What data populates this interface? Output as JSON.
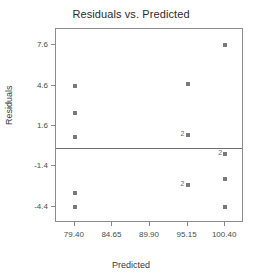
{
  "chart_data": {
    "type": "scatter",
    "title": "Residuals vs. Predicted",
    "xlabel": "Predicted",
    "ylabel": "Residuals",
    "xlim": [
      76.77,
      103.03
    ],
    "ylim": [
      -5.6,
      8.8
    ],
    "grid": false,
    "legend": null,
    "reference_line": {
      "orientation": "horizontal",
      "y": 0.0
    },
    "xticks": [
      79.4,
      84.65,
      89.9,
      95.15,
      100.4
    ],
    "xtick_labels": [
      "79.40",
      "84.65",
      "89.90",
      "95.15",
      "100.40"
    ],
    "yticks": [
      7.6,
      4.6,
      1.6,
      -1.4,
      -4.4
    ],
    "ytick_labels": [
      "7.6",
      "4.6",
      "1.6",
      "-1.4",
      "-4.4"
    ],
    "points": [
      {
        "x": 79.4,
        "y": 4.6,
        "count": 1,
        "label": ""
      },
      {
        "x": 79.4,
        "y": 2.6,
        "count": 1,
        "label": ""
      },
      {
        "x": 79.4,
        "y": 0.75,
        "count": 1,
        "label": ""
      },
      {
        "x": 79.4,
        "y": -3.4,
        "count": 1,
        "label": ""
      },
      {
        "x": 79.4,
        "y": -4.4,
        "count": 1,
        "label": ""
      },
      {
        "x": 95.15,
        "y": 4.75,
        "count": 1,
        "label": ""
      },
      {
        "x": 95.15,
        "y": 0.9,
        "count": 2,
        "label": "2"
      },
      {
        "x": 95.15,
        "y": -2.8,
        "count": 2,
        "label": "2"
      },
      {
        "x": 100.4,
        "y": 7.6,
        "count": 1,
        "label": ""
      },
      {
        "x": 100.4,
        "y": -0.5,
        "count": 2,
        "label": "2"
      },
      {
        "x": 100.4,
        "y": -2.3,
        "count": 1,
        "label": ""
      },
      {
        "x": 100.4,
        "y": -4.4,
        "count": 1,
        "label": ""
      }
    ],
    "colors": {
      "marker": "#7a7a7a",
      "frame": "#8c8c8c",
      "reference_line": "#6f6f6f",
      "title_text": "#2b2b2b",
      "tick_text": "#4a4a4a",
      "axis_title_text": "#3a3a3a",
      "background": "#ffffff"
    }
  }
}
